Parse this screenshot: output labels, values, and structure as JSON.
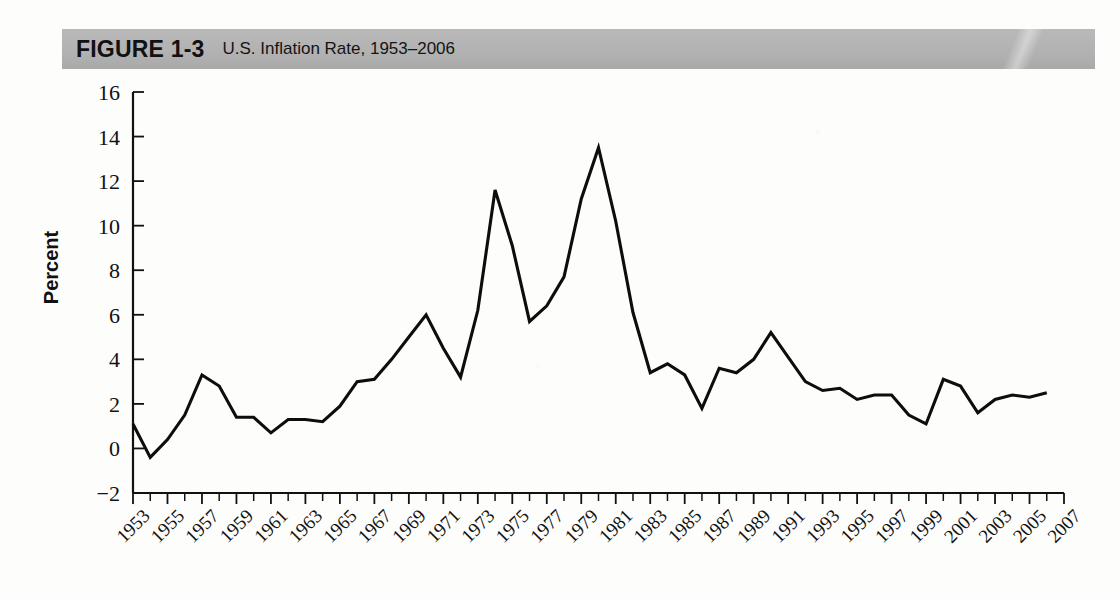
{
  "figure": {
    "label": "FIGURE 1-3",
    "caption": "U.S. Inflation Rate, 1953–2006",
    "title_bar_color": "#b2b2b2",
    "line_color": "#0d0d0d",
    "background_color": "#fdfdfb"
  },
  "chart_data": {
    "type": "line",
    "title": "U.S. Inflation Rate, 1953–2006",
    "xlabel": "",
    "ylabel": "Percent",
    "xlim": [
      1953,
      2007
    ],
    "ylim": [
      -2,
      16
    ],
    "ytick_step": 2,
    "xtick_step": 1,
    "xtick_label_step": 2,
    "grid": false,
    "legend": false,
    "ytick_labels": [
      "16",
      "14",
      "12",
      "10",
      "8",
      "6",
      "4",
      "2",
      "0",
      "−2"
    ],
    "ytick_values": [
      16,
      14,
      12,
      10,
      8,
      6,
      4,
      2,
      0,
      -2
    ],
    "xtick_labels": [
      "1953",
      "1955",
      "1957",
      "1959",
      "1961",
      "1963",
      "1965",
      "1967",
      "1969",
      "1971",
      "1973",
      "1975",
      "1977",
      "1979",
      "1981",
      "1983",
      "1985",
      "1987",
      "1989",
      "1991",
      "1993",
      "1995",
      "1997",
      "1999",
      "2001",
      "2003",
      "2005",
      "2007"
    ],
    "x": [
      1953,
      1954,
      1955,
      1956,
      1957,
      1958,
      1959,
      1960,
      1961,
      1962,
      1963,
      1964,
      1965,
      1966,
      1967,
      1968,
      1969,
      1970,
      1971,
      1972,
      1973,
      1974,
      1975,
      1976,
      1977,
      1978,
      1979,
      1980,
      1981,
      1982,
      1983,
      1984,
      1985,
      1986,
      1987,
      1988,
      1989,
      1990,
      1991,
      1992,
      1993,
      1994,
      1995,
      1996,
      1997,
      1998,
      1999,
      2000,
      2001,
      2002,
      2003,
      2004,
      2005,
      2006
    ],
    "values": [
      1.1,
      -0.4,
      0.4,
      1.5,
      3.3,
      2.8,
      1.4,
      1.4,
      0.7,
      1.3,
      1.3,
      1.2,
      1.9,
      3.0,
      3.1,
      4.0,
      5.0,
      6.0,
      4.5,
      3.2,
      6.2,
      11.6,
      9.1,
      5.7,
      6.4,
      7.7,
      11.2,
      13.5,
      10.2,
      6.1,
      3.4,
      3.8,
      3.3,
      1.8,
      3.6,
      3.4,
      4.0,
      5.2,
      4.1,
      3.0,
      2.6,
      2.7,
      2.2,
      2.4,
      2.4,
      1.5,
      1.1,
      3.1,
      2.8,
      1.6,
      2.2,
      2.4,
      2.3,
      2.5
    ]
  }
}
